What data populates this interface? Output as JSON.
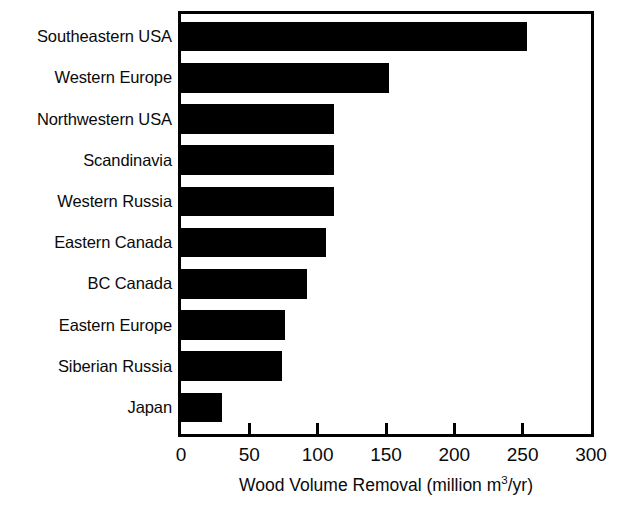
{
  "chart_data": {
    "type": "bar",
    "orientation": "horizontal",
    "title": "",
    "subtitle": "",
    "xlabel": "Wood Volume Removal (million m3/yr)",
    "xlabel_parts": {
      "before_sup": "Wood Volume Removal (million m",
      "sup": "3",
      "after_sup": "/yr)"
    },
    "ylabel": "",
    "categories": [
      "Southeastern USA",
      "Western Europe",
      "Northwestern USA",
      "Scandinavia",
      "Western Russia",
      "Eastern Canada",
      "BC Canada",
      "Eastern Europe",
      "Siberian Russia",
      "Japan"
    ],
    "values": [
      253,
      152,
      112,
      112,
      112,
      106,
      92,
      76,
      74,
      30
    ],
    "xlim": [
      0,
      300
    ],
    "xticks": [
      0,
      50,
      100,
      150,
      200,
      250,
      300
    ],
    "xtick_labels": [
      "0",
      "50",
      "100",
      "150",
      "200",
      "250",
      "300"
    ],
    "grid": false,
    "legend": false,
    "bar_color": "#000000",
    "background_color": "#ffffff",
    "frame_color": "#000000"
  }
}
